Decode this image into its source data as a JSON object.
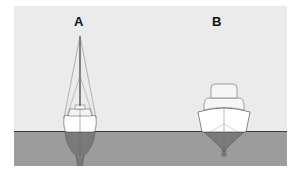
{
  "figure": {
    "labels": {
      "a": "A",
      "b": "B"
    },
    "boats": [
      {
        "id": "A",
        "type": "sailboat",
        "description": "sailboat with mast and rigging, deep keel below waterline"
      },
      {
        "id": "B",
        "type": "motorboat",
        "description": "motor cruiser with cabin, shallow V hull"
      }
    ],
    "colors": {
      "sky": "#ebebeb",
      "water": "#9c9c9c",
      "waterline": "#3a3a3a",
      "hull": "#ffffff",
      "underwater_hull": "#7f7f7f"
    }
  }
}
